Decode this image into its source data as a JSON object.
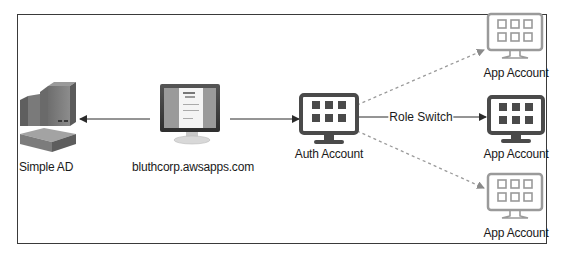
{
  "diagram": {
    "nodes": [
      {
        "id": "simple-ad",
        "label": "Simple AD",
        "icon": "directory-service-icon"
      },
      {
        "id": "portal",
        "label": "bluthcorp.awsapps.com",
        "icon": "login-monitor-icon"
      },
      {
        "id": "auth",
        "label": "Auth Account",
        "icon": "account-monitor-icon"
      },
      {
        "id": "app1",
        "label": "App Account",
        "icon": "account-monitor-icon",
        "style": "outline"
      },
      {
        "id": "app2",
        "label": "App Account",
        "icon": "account-monitor-icon",
        "style": "solid"
      },
      {
        "id": "app3",
        "label": "App Account",
        "icon": "account-monitor-icon",
        "style": "outline"
      }
    ],
    "edges": [
      {
        "from": "portal",
        "to": "simple-ad",
        "style": "solid",
        "label": ""
      },
      {
        "from": "portal",
        "to": "auth",
        "style": "solid",
        "label": ""
      },
      {
        "from": "auth",
        "to": "app2",
        "style": "solid",
        "label": "Role Switch"
      },
      {
        "from": "auth",
        "to": "app1",
        "style": "dashed",
        "label": ""
      },
      {
        "from": "auth",
        "to": "app3",
        "style": "dashed",
        "label": ""
      }
    ],
    "colors": {
      "solid_icon": "#4a4a4a",
      "outline_icon": "#9a9a9a",
      "line": "#2b2b2b",
      "dashed_line": "#9a9a9a",
      "frame": "#3a3a3a"
    }
  }
}
